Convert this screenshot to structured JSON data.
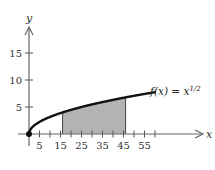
{
  "chart_data": {
    "type": "area",
    "title": "",
    "xlabel": "x",
    "ylabel": "y",
    "function_label": "f(x) = x",
    "function_exponent": "1/2",
    "function": "sqrt",
    "x_range": [
      0,
      60
    ],
    "xlim": [
      0,
      82
    ],
    "ylim": [
      0,
      19.5
    ],
    "x_ticks": [
      5,
      10,
      15,
      20,
      25,
      30,
      35,
      40,
      45,
      50,
      55,
      60
    ],
    "x_tick_labels": [
      "5",
      "15",
      "25",
      "35",
      "45",
      "55"
    ],
    "x_tick_label_values": [
      5,
      15,
      25,
      35,
      45,
      55
    ],
    "y_ticks": [
      5,
      10,
      15
    ],
    "y_tick_labels": [
      "5",
      "10",
      "15"
    ],
    "shaded_region": {
      "from": 16,
      "to": 46,
      "color": "#b3b3b3"
    },
    "curve_color": "#111111",
    "axis_color": "#555555",
    "grid": false,
    "legend": "none",
    "sample_points": [
      {
        "x": 0,
        "y": 0
      },
      {
        "x": 5,
        "y": 2.24
      },
      {
        "x": 15,
        "y": 3.87
      },
      {
        "x": 16,
        "y": 4.0
      },
      {
        "x": 25,
        "y": 5.0
      },
      {
        "x": 35,
        "y": 5.92
      },
      {
        "x": 45,
        "y": 6.71
      },
      {
        "x": 46,
        "y": 6.78
      },
      {
        "x": 55,
        "y": 7.42
      },
      {
        "x": 60,
        "y": 7.75
      }
    ]
  }
}
